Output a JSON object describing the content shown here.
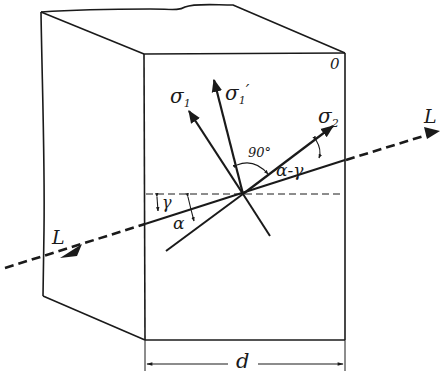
{
  "figure": {
    "type": "crystal plate with light ray and stress axes",
    "colors": {
      "ink": "#1a1a1a",
      "background": "#ffffff"
    }
  },
  "labels": {
    "sigma1": {
      "base": "σ",
      "sub": "1",
      "prime": ""
    },
    "sigma1_prime": {
      "base": "σ",
      "sub": "1",
      "prime": "′"
    },
    "sigma2": {
      "base": "σ",
      "sub": "2",
      "prime": ""
    },
    "angle_90": "90°",
    "angle_alpha_minus_gamma": "α-γ",
    "angle_gamma": "γ",
    "angle_alpha": "α",
    "ray_in": "L",
    "ray_out": "L",
    "corner": "0",
    "thickness": "d"
  }
}
